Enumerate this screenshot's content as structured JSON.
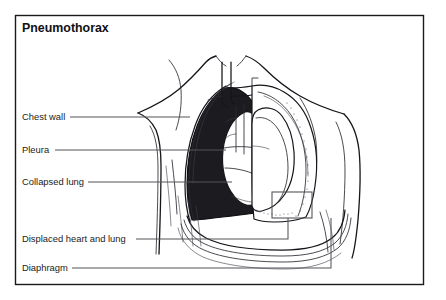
{
  "figure": {
    "title": "Pneumothorax",
    "background_color": "#ffffff",
    "frame_color": "#1a1a1a",
    "air_space_color": "#1b1b20",
    "leader_line_color": "#55555b",
    "organ_fill_color": "#ffffff",
    "outline_color": "#15151a"
  },
  "labels": [
    {
      "id": "chest-wall",
      "text": "Chest wall",
      "text_x": 22,
      "text_y": 120,
      "leader_x1": 70,
      "leader_y1": 117,
      "leader_x2": 190,
      "leader_y2": 117
    },
    {
      "id": "pleura",
      "text": "Pleura",
      "text_x": 22,
      "text_y": 153,
      "leader_x1": 55,
      "leader_y1": 150,
      "leader_x2": 226,
      "leader_y2": 150
    },
    {
      "id": "collapsed-lung",
      "text": "Collapsed lung",
      "text_x": 22,
      "text_y": 185,
      "leader_x1": 88,
      "leader_y1": 182,
      "leader_x2": 232,
      "leader_y2": 182
    },
    {
      "id": "displaced-heart-and-lung",
      "text": "Displaced heart and lung",
      "text_x": 22,
      "text_y": 242,
      "leader_x1": 136,
      "leader_y1": 239,
      "leader_x2": 288,
      "leader_y2": 239
    },
    {
      "id": "diaphragm",
      "text": "Diaphragm",
      "text_x": 22,
      "text_y": 271,
      "leader_x1": 72,
      "leader_y1": 268,
      "leader_x2": 331,
      "leader_y2": 268
    }
  ],
  "annotations": {
    "callout_box": {
      "x": 272,
      "y": 192,
      "width": 40,
      "height": 26
    }
  },
  "structures": [
    {
      "id": "torso-outline",
      "name": "chest wall and shoulders"
    },
    {
      "id": "pleural-air-space",
      "name": "air in pleural space"
    },
    {
      "id": "collapsed-lung-shape",
      "name": "collapsed left lung"
    },
    {
      "id": "normal-lung-shape",
      "name": "normal right lung"
    },
    {
      "id": "displaced-heart-shape",
      "name": "displaced heart"
    },
    {
      "id": "trachea-bronchi",
      "name": "trachea and bronchi"
    },
    {
      "id": "diaphragm-curves",
      "name": "diaphragm"
    }
  ]
}
